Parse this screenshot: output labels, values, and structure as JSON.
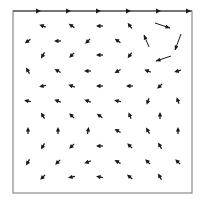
{
  "chart_data": {
    "type": "vector_field",
    "title": "",
    "xlabel": "",
    "ylabel": "",
    "frame": {
      "x0": 13,
      "y0": 11,
      "x1": 192,
      "y1": 193,
      "color": "#8a8a8a",
      "top_color": "#333333"
    },
    "arrow_color": "#1a1a1a",
    "boundary_arrows": [
      {
        "x": 40,
        "y": 11,
        "dx": 1,
        "dy": 0
      },
      {
        "x": 70,
        "y": 11,
        "dx": 1,
        "dy": 0
      },
      {
        "x": 100,
        "y": 11,
        "dx": 1,
        "dy": 0
      },
      {
        "x": 130,
        "y": 11,
        "dx": 1,
        "dy": 0
      },
      {
        "x": 160,
        "y": 11,
        "dx": 1,
        "dy": 0
      },
      {
        "x": 190,
        "y": 11,
        "dx": 1,
        "dy": 0
      }
    ],
    "large_arrows": [
      {
        "x1": 155,
        "y1": 23,
        "x2": 170,
        "y2": 28
      },
      {
        "x1": 149,
        "y1": 47,
        "x2": 144,
        "y2": 35
      },
      {
        "x1": 181,
        "y1": 34,
        "x2": 175,
        "y2": 50
      },
      {
        "x1": 171,
        "y1": 56,
        "x2": 156,
        "y2": 61
      }
    ],
    "small_arrows": [
      {
        "x": 43,
        "y": 26,
        "a": 200
      },
      {
        "x": 72,
        "y": 26,
        "a": 215
      },
      {
        "x": 100,
        "y": 26,
        "a": 180
      },
      {
        "x": 130,
        "y": 26,
        "a": 235
      },
      {
        "x": 28,
        "y": 41,
        "a": 145
      },
      {
        "x": 58,
        "y": 41,
        "a": 180
      },
      {
        "x": 88,
        "y": 41,
        "a": 135
      },
      {
        "x": 118,
        "y": 41,
        "a": 215
      },
      {
        "x": 43,
        "y": 55,
        "a": 120
      },
      {
        "x": 72,
        "y": 55,
        "a": 135
      },
      {
        "x": 100,
        "y": 55,
        "a": 180
      },
      {
        "x": 130,
        "y": 55,
        "a": 125
      },
      {
        "x": 28,
        "y": 71,
        "a": 240
      },
      {
        "x": 58,
        "y": 71,
        "a": 210
      },
      {
        "x": 88,
        "y": 71,
        "a": 180
      },
      {
        "x": 118,
        "y": 71,
        "a": 150
      },
      {
        "x": 148,
        "y": 71,
        "a": 200
      },
      {
        "x": 178,
        "y": 71,
        "a": 165
      },
      {
        "x": 43,
        "y": 86,
        "a": 170
      },
      {
        "x": 72,
        "y": 86,
        "a": 200
      },
      {
        "x": 100,
        "y": 86,
        "a": 180
      },
      {
        "x": 130,
        "y": 86,
        "a": 180
      },
      {
        "x": 160,
        "y": 86,
        "a": 135
      },
      {
        "x": 28,
        "y": 101,
        "a": 190
      },
      {
        "x": 58,
        "y": 101,
        "a": 200
      },
      {
        "x": 88,
        "y": 101,
        "a": 200
      },
      {
        "x": 118,
        "y": 101,
        "a": 190
      },
      {
        "x": 148,
        "y": 101,
        "a": 110
      },
      {
        "x": 178,
        "y": 101,
        "a": 250
      },
      {
        "x": 43,
        "y": 116,
        "a": 240
      },
      {
        "x": 72,
        "y": 116,
        "a": 225
      },
      {
        "x": 100,
        "y": 116,
        "a": 215
      },
      {
        "x": 130,
        "y": 116,
        "a": 250
      },
      {
        "x": 160,
        "y": 116,
        "a": 270
      },
      {
        "x": 28,
        "y": 131,
        "a": 270
      },
      {
        "x": 58,
        "y": 131,
        "a": 270
      },
      {
        "x": 88,
        "y": 131,
        "a": 280
      },
      {
        "x": 118,
        "y": 131,
        "a": 210
      },
      {
        "x": 148,
        "y": 131,
        "a": 240
      },
      {
        "x": 178,
        "y": 131,
        "a": 270
      },
      {
        "x": 43,
        "y": 146,
        "a": 120
      },
      {
        "x": 72,
        "y": 146,
        "a": 135
      },
      {
        "x": 100,
        "y": 146,
        "a": 180
      },
      {
        "x": 130,
        "y": 146,
        "a": 225
      },
      {
        "x": 160,
        "y": 146,
        "a": 240
      },
      {
        "x": 28,
        "y": 162,
        "a": 120
      },
      {
        "x": 58,
        "y": 162,
        "a": 135
      },
      {
        "x": 88,
        "y": 162,
        "a": 160
      },
      {
        "x": 118,
        "y": 162,
        "a": 210
      },
      {
        "x": 148,
        "y": 162,
        "a": 225
      },
      {
        "x": 178,
        "y": 162,
        "a": 225
      },
      {
        "x": 43,
        "y": 177,
        "a": 135
      },
      {
        "x": 72,
        "y": 177,
        "a": 170
      },
      {
        "x": 100,
        "y": 177,
        "a": 190
      },
      {
        "x": 130,
        "y": 177,
        "a": 220
      },
      {
        "x": 160,
        "y": 177,
        "a": 240
      }
    ]
  }
}
